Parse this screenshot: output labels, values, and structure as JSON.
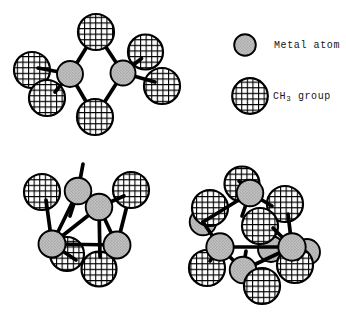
{
  "legend": {
    "metal_label": "Metal atom",
    "ch3_prefix": "CH",
    "ch3_sub": "3",
    "ch3_suffix": " group"
  },
  "colors": {
    "background": "#ffffff",
    "outline": "#000000",
    "crosshatch_line": "#000000",
    "metal_fill": "#bfbfbf",
    "metal_dot": "#8f8f8f"
  },
  "canvas": {
    "width": 346,
    "height": 312
  },
  "structures": [
    {
      "name": "structure-dimer-bridged",
      "elements": [
        {
          "kind": "bond",
          "x1": 70,
          "y1": 74,
          "x2": 96,
          "y2": 32
        },
        {
          "kind": "bond",
          "x1": 123,
          "y1": 73,
          "x2": 96,
          "y2": 32
        },
        {
          "kind": "bond",
          "x1": 70,
          "y1": 74,
          "x2": 95,
          "y2": 117
        },
        {
          "kind": "bond",
          "x1": 123,
          "y1": 73,
          "x2": 95,
          "y2": 117
        },
        {
          "kind": "ch3",
          "x": 32,
          "y": 70,
          "r": 18
        },
        {
          "kind": "ch3",
          "x": 47,
          "y": 98,
          "r": 18
        },
        {
          "kind": "ch3",
          "x": 145.5,
          "y": 52,
          "r": 17.5
        },
        {
          "kind": "ch3",
          "x": 162,
          "y": 86,
          "r": 18
        },
        {
          "kind": "ch3",
          "x": 96,
          "y": 32,
          "r": 18
        },
        {
          "kind": "ch3",
          "x": 95,
          "y": 117,
          "r": 18
        },
        {
          "kind": "bond",
          "x1": 70,
          "y1": 74,
          "x2": 38,
          "y2": 68
        },
        {
          "kind": "bond",
          "x1": 70,
          "y1": 74,
          "x2": 55,
          "y2": 92
        },
        {
          "kind": "bond",
          "x1": 123,
          "y1": 73,
          "x2": 141.5,
          "y2": 58.5
        },
        {
          "kind": "bond",
          "x1": 123,
          "y1": 73,
          "x2": 155,
          "y2": 82
        },
        {
          "kind": "metal",
          "x": 70,
          "y": 74,
          "r": 13
        },
        {
          "kind": "metal",
          "x": 123,
          "y": 73,
          "r": 12.5
        }
      ]
    },
    {
      "name": "structure-tetramer-cluster",
      "elements": [
        {
          "kind": "bond",
          "x1": 78,
          "y1": 191,
          "x2": 52,
          "y2": 244
        },
        {
          "kind": "bond",
          "x1": 99,
          "y1": 207,
          "x2": 52,
          "y2": 244
        },
        {
          "kind": "bond",
          "x1": 99,
          "y1": 207,
          "x2": 117,
          "y2": 245
        },
        {
          "kind": "bond",
          "x1": 117,
          "y1": 245,
          "x2": 131,
          "y2": 190
        },
        {
          "kind": "bond",
          "x1": 78,
          "y1": 191,
          "x2": 83,
          "y2": 164
        },
        {
          "kind": "bond",
          "x1": 78,
          "y1": 191,
          "x2": 70,
          "y2": 216
        },
        {
          "kind": "ch3",
          "x": 42,
          "y": 192,
          "r": 18
        },
        {
          "kind": "ch3",
          "x": 131,
          "y": 190,
          "r": 18
        },
        {
          "kind": "ch3",
          "x": 67,
          "y": 254,
          "r": 17
        },
        {
          "kind": "ch3",
          "x": 99,
          "y": 269,
          "r": 17.5
        },
        {
          "kind": "bond",
          "x1": 46,
          "y1": 200,
          "x2": 52,
          "y2": 244
        },
        {
          "kind": "bond",
          "x1": 124,
          "y1": 196,
          "x2": 99,
          "y2": 207
        },
        {
          "kind": "bond",
          "x1": 52,
          "y1": 244,
          "x2": 117,
          "y2": 245
        },
        {
          "kind": "bond",
          "x1": 52,
          "y1": 244,
          "x2": 76,
          "y2": 260
        },
        {
          "kind": "bond",
          "x1": 99,
          "y1": 207,
          "x2": 100,
          "y2": 257
        },
        {
          "kind": "metal",
          "x": 78,
          "y": 191,
          "r": 13.3
        },
        {
          "kind": "metal",
          "x": 99,
          "y": 207,
          "r": 13.3
        },
        {
          "kind": "metal",
          "x": 52,
          "y": 244,
          "r": 13.5
        },
        {
          "kind": "metal",
          "x": 117,
          "y": 245,
          "r": 13.5
        }
      ]
    },
    {
      "name": "structure-hexamer-cluster",
      "elements": [
        {
          "kind": "metal",
          "x": 203,
          "y": 222,
          "r": 13.3
        },
        {
          "kind": "ch3",
          "x": 210,
          "y": 208,
          "r": 18
        },
        {
          "kind": "metal",
          "x": 271,
          "y": 249,
          "r": 13
        },
        {
          "kind": "metal",
          "x": 307,
          "y": 252,
          "r": 13
        },
        {
          "kind": "ch3",
          "x": 242,
          "y": 184,
          "r": 17.5
        },
        {
          "kind": "ch3",
          "x": 285,
          "y": 204,
          "r": 18
        },
        {
          "kind": "ch3",
          "x": 260,
          "y": 226,
          "r": 18
        },
        {
          "kind": "ch3",
          "x": 207,
          "y": 268,
          "r": 18
        },
        {
          "kind": "ch3",
          "x": 295,
          "y": 265,
          "r": 18
        },
        {
          "kind": "bond",
          "x1": 250,
          "y1": 193,
          "x2": 203,
          "y2": 222
        },
        {
          "kind": "bond",
          "x1": 250,
          "y1": 193,
          "x2": 272,
          "y2": 206
        },
        {
          "kind": "bond",
          "x1": 250,
          "y1": 193,
          "x2": 242,
          "y2": 216
        },
        {
          "kind": "bond",
          "x1": 250,
          "y1": 193,
          "x2": 239,
          "y2": 181
        },
        {
          "kind": "bond",
          "x1": 203,
          "y1": 222,
          "x2": 220,
          "y2": 247
        },
        {
          "kind": "bond",
          "x1": 220,
          "y1": 247,
          "x2": 292,
          "y2": 247
        },
        {
          "kind": "bond",
          "x1": 220,
          "y1": 247,
          "x2": 243,
          "y2": 270
        },
        {
          "kind": "bond",
          "x1": 220,
          "y1": 247,
          "x2": 210,
          "y2": 261
        },
        {
          "kind": "bond",
          "x1": 292,
          "y1": 247,
          "x2": 273,
          "y2": 228
        },
        {
          "kind": "bond",
          "x1": 292,
          "y1": 247,
          "x2": 288,
          "y2": 214
        },
        {
          "kind": "bond",
          "x1": 292,
          "y1": 247,
          "x2": 298,
          "y2": 259
        },
        {
          "kind": "bond",
          "x1": 243,
          "y1": 270,
          "x2": 292,
          "y2": 247
        },
        {
          "kind": "bond",
          "x1": 243,
          "y1": 270,
          "x2": 246,
          "y2": 251
        },
        {
          "kind": "metal",
          "x": 243,
          "y": 270,
          "r": 13.3
        },
        {
          "kind": "ch3",
          "x": 262,
          "y": 286,
          "r": 18
        },
        {
          "kind": "metal",
          "x": 250,
          "y": 193,
          "r": 13.3
        },
        {
          "kind": "metal",
          "x": 220,
          "y": 247,
          "r": 13.7
        },
        {
          "kind": "metal",
          "x": 292,
          "y": 247,
          "r": 13.7
        }
      ]
    }
  ]
}
